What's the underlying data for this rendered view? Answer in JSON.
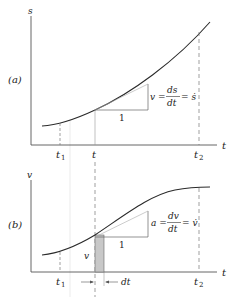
{
  "panel_a": {
    "label": "(a)",
    "y_axis_label": "s",
    "x_axis_label": "t",
    "ticks": {
      "t1": "t",
      "t1_sub": "1",
      "t": "t",
      "t2": "t",
      "t2_sub": "2"
    },
    "slope_unit": "1",
    "equation": {
      "lhs": "v =",
      "num": "ds",
      "den": "dt",
      "rhs": "= ṡ"
    }
  },
  "panel_b": {
    "label": "(b)",
    "y_axis_label": "v",
    "x_axis_label": "t",
    "ticks": {
      "t1": "t",
      "t1_sub": "1",
      "t2": "t",
      "t2_sub": "2"
    },
    "slope_unit": "1",
    "strip_label": "v",
    "dt_label": "dt",
    "equation": {
      "lhs": "a =",
      "num": "dv",
      "den": "dt",
      "rhs": "= v̇"
    }
  },
  "colors": {
    "curve": "#2a2a2a",
    "axis": "#555555",
    "dash": "#777777",
    "strip": "#c8c8c8"
  }
}
